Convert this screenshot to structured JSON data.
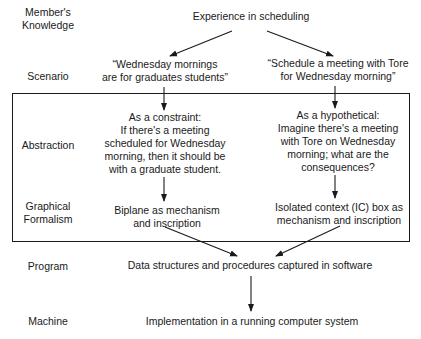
{
  "levels": {
    "member_knowledge": "Member's\nKnowledge",
    "scenario": "Scenario",
    "abstraction": "Abstraction",
    "graphical_formalism": "Graphical\nFormalism",
    "program": "Program",
    "machine": "Machine"
  },
  "nodes": {
    "experience": "Experience in scheduling",
    "scenario_left": "“Wednesday mornings\nare for graduates students”",
    "scenario_right": "“Schedule a meeting with Tore\nfor Wednesday morning”",
    "abstraction_left": "As a constraint:\nIf there's a meeting\nscheduled for Wednesday\nmorning, then it should be\nwith a graduate student.",
    "abstraction_right": "As a hypothetical:\nImagine there's a meeting\nwith Tore on Wednesday\nmorning; what are the\nconsequences?",
    "formalism_left": "Biplane as mechanism\nand inscription",
    "formalism_right": "Isolated context (IC) box as\nmechanism and inscription",
    "program": "Data structures and procedures captured in software",
    "machine": "Implementation in a running computer system"
  },
  "colors": {
    "ink": "#1a1a1a",
    "background": "#ffffff"
  }
}
